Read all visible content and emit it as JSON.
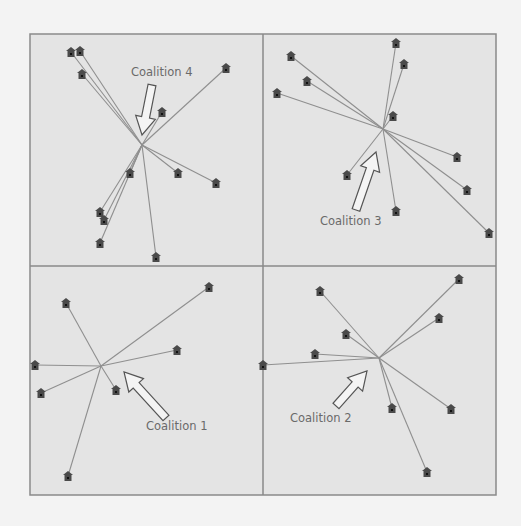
{
  "figure": {
    "frame": {
      "x": 30,
      "y": 34,
      "w": 466,
      "h": 461
    },
    "dividers": {
      "vx": 263,
      "hy": 266
    },
    "colors": {
      "panel_bg": "#e4e4e4",
      "border": "#8a8a8a",
      "line": "#8f8f8f",
      "house": "#4a4a4a",
      "text": "#6a6a6a",
      "page_bg": "#f3f3f3"
    },
    "coalitions": [
      {
        "label": "Coalition 4",
        "hub": [
          142,
          145
        ],
        "label_pos": [
          131,
          76
        ],
        "arrow": {
          "from": [
            152,
            85
          ],
          "to": [
            142,
            135
          ]
        },
        "houses": [
          [
            71,
            52
          ],
          [
            80,
            51
          ],
          [
            82,
            74
          ],
          [
            162,
            112
          ],
          [
            226,
            68
          ],
          [
            130,
            173
          ],
          [
            178,
            173
          ],
          [
            216,
            183
          ],
          [
            100,
            212
          ],
          [
            104,
            220
          ],
          [
            100,
            243
          ],
          [
            156,
            257
          ]
        ]
      },
      {
        "label": "Coalition 3",
        "hub": [
          383,
          129
        ],
        "label_pos": [
          320,
          225
        ],
        "arrow": {
          "from": [
            356,
            210
          ],
          "to": [
            376,
            152
          ]
        },
        "houses": [
          [
            291,
            56
          ],
          [
            307,
            81
          ],
          [
            277,
            93
          ],
          [
            396,
            43
          ],
          [
            404,
            64
          ],
          [
            393,
            116
          ],
          [
            457,
            157
          ],
          [
            467,
            190
          ],
          [
            489,
            233
          ],
          [
            347,
            175
          ],
          [
            396,
            211
          ]
        ]
      },
      {
        "label": "Coalition 1",
        "hub": [
          101,
          366
        ],
        "label_pos": [
          146,
          430
        ],
        "arrow": {
          "from": [
            166,
            418
          ],
          "to": [
            124,
            372
          ]
        },
        "houses": [
          [
            66,
            303
          ],
          [
            209,
            287
          ],
          [
            177,
            350
          ],
          [
            35,
            365
          ],
          [
            41,
            393
          ],
          [
            116,
            390
          ],
          [
            68,
            476
          ]
        ]
      },
      {
        "label": "Coalition 2",
        "hub": [
          379,
          358
        ],
        "label_pos": [
          290,
          422
        ],
        "arrow": {
          "from": [
            336,
            406
          ],
          "to": [
            367,
            371
          ]
        },
        "houses": [
          [
            320,
            291
          ],
          [
            346,
            334
          ],
          [
            315,
            354
          ],
          [
            263,
            365
          ],
          [
            459,
            279
          ],
          [
            439,
            318
          ],
          [
            392,
            408
          ],
          [
            451,
            409
          ],
          [
            427,
            472
          ]
        ]
      }
    ]
  }
}
